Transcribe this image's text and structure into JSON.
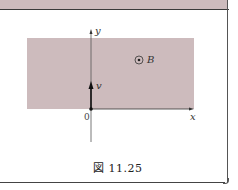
{
  "figure": {
    "caption": "図 11.25",
    "labels": {
      "y_axis": "y",
      "x_axis": "x",
      "origin": "0",
      "velocity": "v",
      "field": "B"
    },
    "field_symbol": "out-of-page-icon",
    "region_color": "#cdbbbd",
    "axis_color": "#333333"
  }
}
